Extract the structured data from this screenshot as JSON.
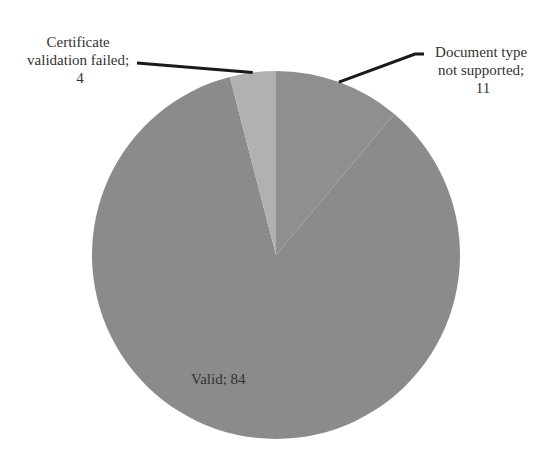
{
  "chart_data": {
    "type": "pie",
    "title": "",
    "start_angle_deg": 0,
    "direction": "clockwise",
    "total": 99,
    "slices": [
      {
        "label": "Document type not supported",
        "value": 11,
        "color": "#8f8f8f",
        "label_lines": [
          "Document type",
          "not supported;",
          "11"
        ],
        "label_position": "outside-top-right"
      },
      {
        "label": "Valid",
        "value": 84,
        "color": "#8b8b8b",
        "label_lines": [
          "Valid; 84"
        ],
        "label_position": "inside-bottom-left"
      },
      {
        "label": "Certificate validation failed",
        "value": 4,
        "color": "#b1b1b1",
        "label_lines": [
          "Certificate",
          "validation failed;",
          "4"
        ],
        "label_position": "outside-top-left"
      }
    ],
    "legend": "none",
    "data_labels": "category; value"
  }
}
